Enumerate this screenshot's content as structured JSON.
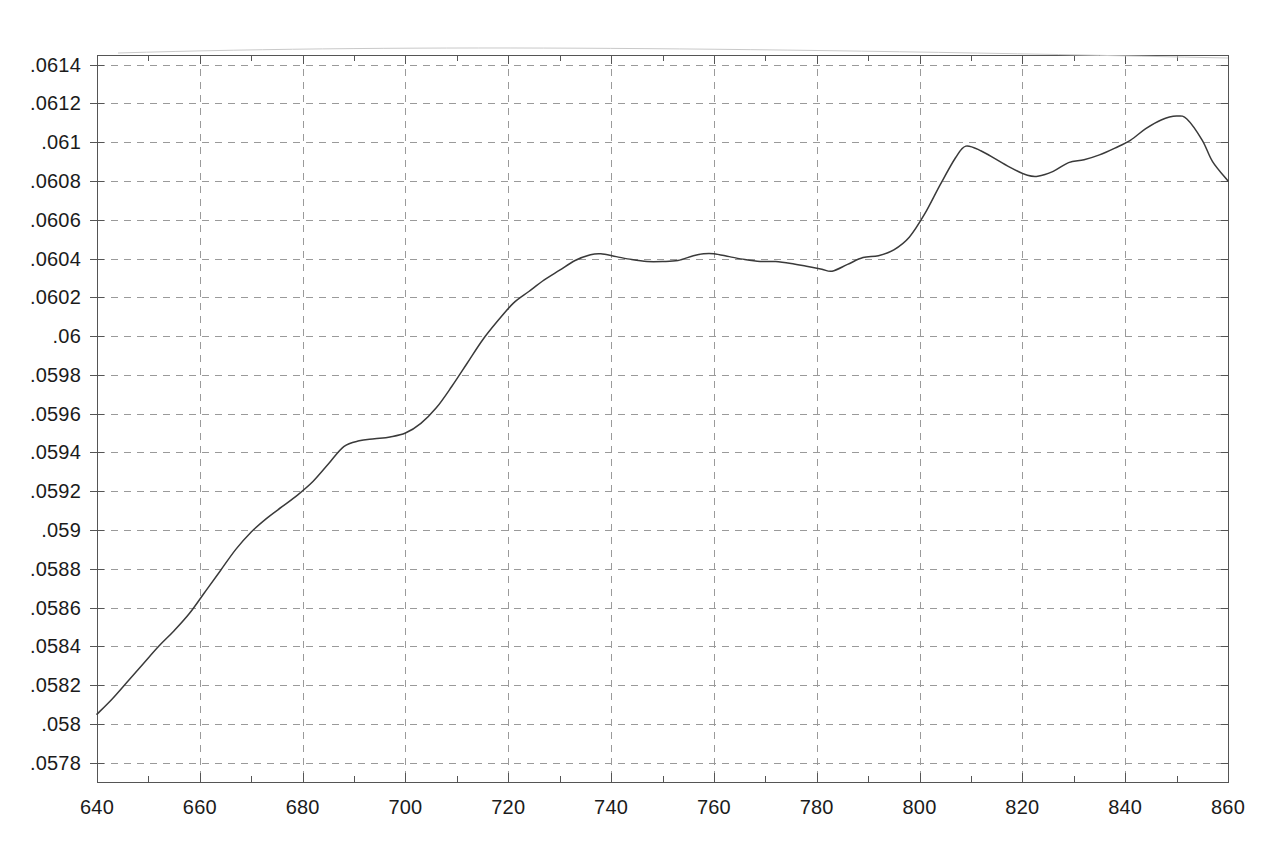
{
  "figure": {
    "background_color": "#ffffff",
    "line_color": "#3a3a3a",
    "grid_color": "#9a9a9a",
    "axis_color": "#555555",
    "text_color": "#1b1b1b"
  },
  "chart_data": {
    "type": "line",
    "title": "",
    "subtitle": "",
    "xlabel": "",
    "ylabel": "",
    "xlim": [
      640,
      860
    ],
    "ylim": [
      0.0577,
      0.06145
    ],
    "grid": true,
    "grid_style": "dashed",
    "legend": null,
    "legend_position": "none",
    "x_major_tick_step": 20,
    "x_minor_tick_step": 10,
    "y_tick_step": 0.0002,
    "x_tick_labels": [
      "640",
      "660",
      "680",
      "700",
      "720",
      "740",
      "760",
      "780",
      "800",
      "820",
      "840",
      "860"
    ],
    "x_tick_values": [
      640,
      660,
      680,
      700,
      720,
      740,
      760,
      780,
      800,
      820,
      840,
      860
    ],
    "y_tick_labels": [
      ".0614",
      ".0612",
      ".061",
      ".0608",
      ".0606",
      ".0604",
      ".0602",
      ".06",
      ".0598",
      ".0596",
      ".0594",
      ".0592",
      ".059",
      ".0588",
      ".0586",
      ".0584",
      ".0582",
      ".058",
      ".0578"
    ],
    "y_tick_values": [
      0.0614,
      0.0612,
      0.061,
      0.0608,
      0.0606,
      0.0604,
      0.0602,
      0.06,
      0.0598,
      0.0596,
      0.0594,
      0.0592,
      0.059,
      0.0588,
      0.0586,
      0.0584,
      0.0582,
      0.058,
      0.0578
    ],
    "series": [
      {
        "name": "curve",
        "x": [
          640,
          643,
          646,
          649,
          652,
          655,
          658,
          661,
          664,
          667,
          670,
          673,
          676,
          679,
          682,
          685,
          688,
          691,
          694,
          697,
          700,
          703,
          706,
          709,
          712,
          715,
          718,
          721,
          724,
          727,
          730,
          733,
          736,
          738,
          741,
          744,
          747,
          750,
          753,
          756,
          758,
          760,
          763,
          766,
          769,
          772,
          775,
          778,
          781,
          783,
          786,
          789,
          792,
          795,
          798,
          801,
          804,
          807,
          809,
          812,
          815,
          818,
          821,
          823,
          826,
          829,
          832,
          835,
          838,
          841,
          844,
          847,
          850,
          852,
          855,
          857,
          860
        ],
        "y": [
          0.05805,
          0.05813,
          0.05822,
          0.05831,
          0.0584,
          0.05848,
          0.05857,
          0.05868,
          0.05879,
          0.0589,
          0.05899,
          0.05906,
          0.05912,
          0.05918,
          0.05925,
          0.05934,
          0.05943,
          0.05946,
          0.05947,
          0.05948,
          0.0595,
          0.05955,
          0.05963,
          0.05974,
          0.05986,
          0.05998,
          0.06008,
          0.06017,
          0.06023,
          0.06029,
          0.06034,
          0.06039,
          0.06042,
          0.060425,
          0.06041,
          0.060395,
          0.060385,
          0.060385,
          0.06039,
          0.060415,
          0.060425,
          0.060425,
          0.06041,
          0.060395,
          0.060385,
          0.060385,
          0.060375,
          0.06036,
          0.060345,
          0.060335,
          0.06037,
          0.060405,
          0.060415,
          0.060445,
          0.06051,
          0.06063,
          0.06078,
          0.06092,
          0.06098,
          0.060955,
          0.06091,
          0.060865,
          0.06083,
          0.060825,
          0.06085,
          0.060895,
          0.06091,
          0.060935,
          0.06097,
          0.06101,
          0.06107,
          0.061115,
          0.061135,
          0.06112,
          0.06101,
          0.0609,
          0.0608
        ]
      }
    ]
  },
  "axes": {
    "plot_left_px": 97,
    "plot_right_px": 1228,
    "plot_top_px": 55,
    "plot_bottom_px": 782
  }
}
